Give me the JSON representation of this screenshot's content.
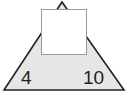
{
  "puzzle": {
    "left_value": "4",
    "right_value": "10",
    "top_value": "",
    "colors": {
      "triangle_fill": "#e6e6e6",
      "triangle_stroke": "#222222",
      "box_fill": "#ffffff",
      "box_border": "#9a9a9a"
    }
  }
}
